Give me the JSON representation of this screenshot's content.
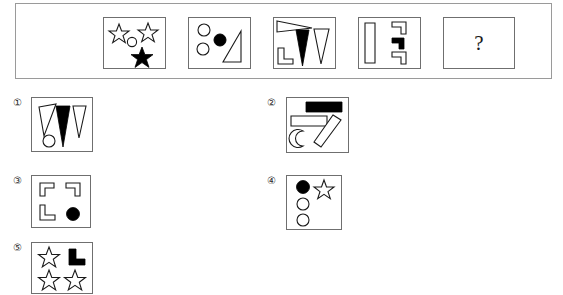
{
  "puzzle": {
    "type": "visual-analogy-matrix",
    "question_symbol": "?",
    "sequence": {
      "count": 5,
      "cells": [
        {
          "index": 1,
          "name": "sequence-cell-1",
          "description": "two outlined stars, small outlined circle, one filled black star",
          "shapes": [
            {
              "kind": "star",
              "fill": "outline",
              "position": "top-left"
            },
            {
              "kind": "star",
              "fill": "outline",
              "position": "top-right"
            },
            {
              "kind": "circle",
              "fill": "outline",
              "position": "center"
            },
            {
              "kind": "star",
              "fill": "black",
              "position": "bottom-center"
            }
          ]
        },
        {
          "index": 2,
          "name": "sequence-cell-2",
          "description": "two outlined circles, one filled black circle, one outlined right triangle",
          "shapes": [
            {
              "kind": "circle",
              "fill": "outline",
              "position": "top-left"
            },
            {
              "kind": "circle",
              "fill": "outline",
              "position": "mid-left"
            },
            {
              "kind": "circle",
              "fill": "black",
              "position": "center"
            },
            {
              "kind": "right-triangle",
              "fill": "outline",
              "position": "right"
            }
          ]
        },
        {
          "index": 3,
          "name": "sequence-cell-3",
          "description": "outlined thin wedge, outlined L-corner, filled black narrow triangle, outlined narrow triangle",
          "shapes": [
            {
              "kind": "wedge",
              "fill": "outline",
              "position": "top-left"
            },
            {
              "kind": "l-corner",
              "fill": "outline",
              "position": "bottom-left"
            },
            {
              "kind": "narrow-triangle",
              "fill": "black",
              "position": "center"
            },
            {
              "kind": "narrow-triangle",
              "fill": "outline",
              "position": "right"
            }
          ]
        },
        {
          "index": 4,
          "name": "sequence-cell-4",
          "description": "tall outlined bar, two outlined L-corners, one filled black L-corner",
          "shapes": [
            {
              "kind": "bar",
              "fill": "outline",
              "position": "left"
            },
            {
              "kind": "l-corner",
              "fill": "outline",
              "position": "top-right"
            },
            {
              "kind": "l-corner",
              "fill": "black",
              "position": "mid-right"
            },
            {
              "kind": "l-corner",
              "fill": "outline",
              "position": "bottom-right"
            }
          ]
        },
        {
          "index": 5,
          "name": "sequence-cell-question",
          "description": "unknown answer cell containing a question mark",
          "shapes": []
        }
      ]
    },
    "options": [
      {
        "index": 1,
        "label": "①",
        "name": "option-1",
        "description": "two outlined triangles, one filled black triangle, one small outlined circle",
        "shapes": [
          {
            "kind": "narrow-triangle",
            "fill": "outline",
            "position": "left-tilted"
          },
          {
            "kind": "circle",
            "fill": "outline",
            "position": "bottom-left"
          },
          {
            "kind": "narrow-triangle",
            "fill": "black",
            "position": "center"
          },
          {
            "kind": "narrow-triangle",
            "fill": "outline",
            "position": "right"
          }
        ]
      },
      {
        "index": 2,
        "label": "②",
        "name": "option-2",
        "description": "filled black rectangle, outlined rectangle, crescent moon, tilted outlined rectangle",
        "shapes": [
          {
            "kind": "rectangle",
            "fill": "black",
            "position": "top-right"
          },
          {
            "kind": "rectangle",
            "fill": "outline",
            "position": "upper-left"
          },
          {
            "kind": "crescent",
            "fill": "outline",
            "position": "bottom-left"
          },
          {
            "kind": "tilted-rectangle",
            "fill": "outline",
            "position": "bottom-right"
          }
        ]
      },
      {
        "index": 3,
        "label": "③",
        "name": "option-3",
        "description": "three outlined L-corners and one filled black circle",
        "shapes": [
          {
            "kind": "l-corner",
            "fill": "outline",
            "position": "top-left"
          },
          {
            "kind": "l-corner",
            "fill": "outline",
            "position": "top-right"
          },
          {
            "kind": "l-corner",
            "fill": "outline",
            "position": "bottom-left"
          },
          {
            "kind": "circle",
            "fill": "black",
            "position": "bottom-right"
          }
        ]
      },
      {
        "index": 4,
        "label": "④",
        "name": "option-4",
        "description": "one filled black circle, one outlined star, two outlined circles",
        "shapes": [
          {
            "kind": "circle",
            "fill": "black",
            "position": "top-left"
          },
          {
            "kind": "star",
            "fill": "outline",
            "position": "top-right"
          },
          {
            "kind": "circle",
            "fill": "outline",
            "position": "mid-left"
          },
          {
            "kind": "circle",
            "fill": "outline",
            "position": "bottom-left"
          }
        ]
      },
      {
        "index": 5,
        "label": "⑤",
        "name": "option-5",
        "description": "three outlined stars and one filled black L-corner",
        "shapes": [
          {
            "kind": "star",
            "fill": "outline",
            "position": "top-left"
          },
          {
            "kind": "l-corner",
            "fill": "black",
            "position": "top-right"
          },
          {
            "kind": "star",
            "fill": "outline",
            "position": "bottom-left"
          },
          {
            "kind": "star",
            "fill": "outline",
            "position": "bottom-right"
          }
        ]
      }
    ]
  },
  "colors": {
    "background": "#ffffff",
    "stroke": "#1a1a1a",
    "fill_solid": "#000000",
    "frame_border": "#9a9a9a",
    "cell_border": "#6f6f6f"
  }
}
